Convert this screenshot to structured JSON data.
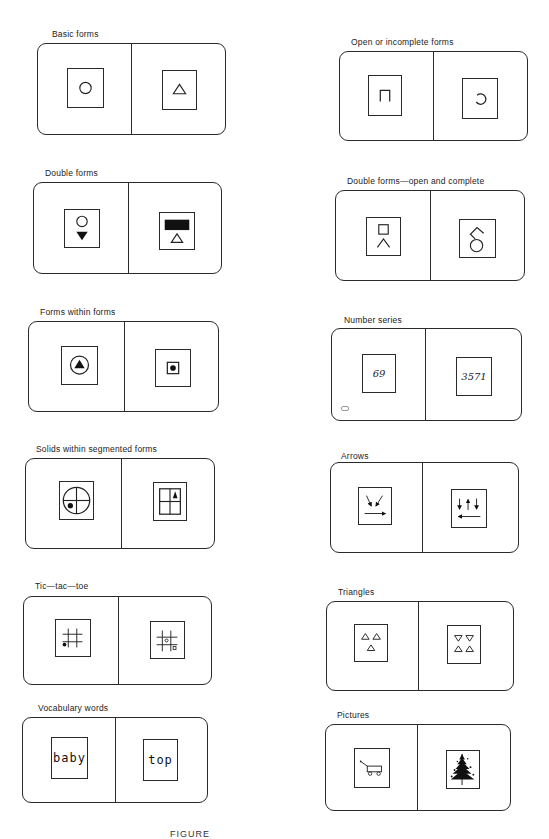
{
  "panels": {
    "basic_forms": {
      "label": "Basic forms",
      "left_symbol": "circle-outline",
      "right_symbol": "triangle-outline"
    },
    "open_forms": {
      "label": "Open or incomplete forms",
      "left_symbol": "open-square-bracket",
      "right_symbol": "open-circle-arc"
    },
    "double_forms": {
      "label": "Double forms",
      "left_symbol": "circle-over-filled-down-triangle",
      "right_symbol": "filled-rectangle-over-triangle"
    },
    "double_open_complete": {
      "label": "Double forms—open and complete",
      "left_symbol": "square-over-caret",
      "right_symbol": "chevron-over-circle"
    },
    "forms_within_forms": {
      "label": "Forms within forms",
      "left_symbol": "filled-triangle-in-circle",
      "right_symbol": "dot-in-square"
    },
    "number_series": {
      "label": "Number series",
      "left_value": "69",
      "right_value": "3571"
    },
    "solids_segmented": {
      "label": "Solids within segmented forms",
      "left_symbol": "dot-in-quartered-circle",
      "right_symbol": "triangle-in-quartered-square"
    },
    "arrows": {
      "label": "Arrows",
      "left_symbol": "two-diagonal-down-arrows-and-right-arrow",
      "right_symbol": "down-up-down-arrows-and-left-arrow"
    },
    "tic_tac_toe": {
      "label": "Tic—tac—toe",
      "left_symbol": "grid-with-dot",
      "right_symbol": "grid-with-two-circles"
    },
    "triangles": {
      "label": "Triangles",
      "left_symbol": "three-up-triangles",
      "right_symbol": "two-down-two-up-triangles"
    },
    "vocabulary_words": {
      "label": "Vocabulary words",
      "left_word": "baby",
      "right_word": "top"
    },
    "pictures": {
      "label": "Pictures",
      "left_symbol": "wagon-picture",
      "right_symbol": "tree-picture"
    }
  },
  "caption": "FIGURE"
}
